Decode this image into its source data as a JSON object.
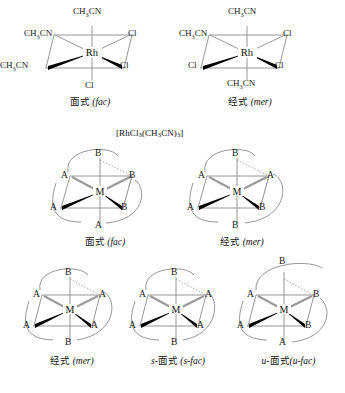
{
  "document": {
    "title": "Octahedral fac / mer isomers of [RhCl3(CH3CN)3] and M(AB)3 chelates",
    "formula_label": "[RhCl3(CH3CN)3]",
    "formula_parts": {
      "a": "[RhCl",
      "sub1": "3",
      "b": "(CH",
      "sub2": "3",
      "c": "CN)",
      "sub3": "3",
      "d": "]"
    },
    "bottom_note": ""
  },
  "row1": {
    "structures": [
      {
        "id": "rh-fac",
        "center_label": "Rh",
        "caption_cn": "面式",
        "caption_en": "(fac)",
        "vertices": {
          "top": "CH3CN",
          "bottom": "Cl",
          "upper_left": "CH3CN",
          "upper_right": "Cl",
          "lower_left": "CH3CN",
          "lower_right": "Cl"
        }
      },
      {
        "id": "rh-mer",
        "center_label": "Rh",
        "caption_cn": "经式",
        "caption_en": "(mer)",
        "vertices": {
          "top": "CH3CN",
          "bottom": "CH3CN",
          "upper_left": "CH3CN",
          "upper_right": "Cl",
          "lower_left": "Cl",
          "lower_right": "Cl"
        }
      }
    ]
  },
  "row2": {
    "structures": [
      {
        "id": "chelate-fac",
        "center_label": "M",
        "caption_cn": "面式",
        "caption_en": "(fac)",
        "vertices": {
          "top": "B",
          "bottom": "A",
          "upper_left": "A",
          "upper_right": "B",
          "lower_left": "A",
          "lower_right": "B"
        }
      },
      {
        "id": "chelate-mer",
        "center_label": "M",
        "caption_cn": "经式",
        "caption_en": "(mer)",
        "vertices": {
          "top": "B",
          "bottom": "B",
          "upper_left": "A",
          "upper_right": "A",
          "lower_left": "A",
          "lower_right": "B"
        }
      }
    ]
  },
  "row3": {
    "structures": [
      {
        "id": "chelate-mer-2",
        "center_label": "M",
        "caption_cn": "经式",
        "caption_en": "(mer)",
        "caption_prefix": "",
        "vertices": {
          "top": "B",
          "bottom": "B",
          "upper_left": "A",
          "upper_right": "A",
          "lower_left": "A",
          "lower_right": "A"
        }
      },
      {
        "id": "chelate-s-fac",
        "center_label": "M",
        "caption_cn": "面式",
        "caption_en": "(s-fac)",
        "caption_prefix": "s-",
        "vertices": {
          "top": "B",
          "bottom": "B",
          "upper_left": "A",
          "upper_right": "A",
          "lower_left": "A",
          "lower_right": "A"
        }
      },
      {
        "id": "chelate-u-fac",
        "center_label": "M",
        "caption_cn": "面式",
        "caption_en": "(u-fac)",
        "caption_prefix": "u-",
        "vertices": {
          "top": "B",
          "bottom": "A",
          "upper_left": "A",
          "upper_right": "B",
          "lower_left": "A",
          "lower_right": "B"
        }
      }
    ]
  },
  "colors": {
    "ink": "#111111",
    "thin_bond": "#8a8a8a",
    "bold_bond": "#000000",
    "arc": "#8a8a8a",
    "dotted": "#9a9a9a"
  }
}
